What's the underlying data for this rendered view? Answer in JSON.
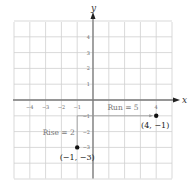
{
  "chart_data": {
    "type": "scatter",
    "title": "",
    "xlabel": "x",
    "ylabel": "y",
    "xlim": [
      -5,
      5
    ],
    "ylim": [
      -5,
      5
    ],
    "grid": true,
    "x_ticks": [
      -4,
      -3,
      -2,
      -1,
      4
    ],
    "y_ticks": [
      4,
      3,
      2,
      1,
      -1,
      -2,
      -3
    ],
    "points": [
      {
        "x": -1,
        "y": -3,
        "label": "(−1, −3)"
      },
      {
        "x": 4,
        "y": -1,
        "label": "(4, −1)"
      }
    ],
    "annotations": [
      {
        "text": "Rise = 2",
        "type": "vertical-segment",
        "from": [
          -1,
          -3
        ],
        "to": [
          -1,
          -1
        ]
      },
      {
        "text": "Run = 5",
        "type": "horizontal-arrow",
        "from": [
          -1,
          -1
        ],
        "to": [
          4,
          -1
        ]
      }
    ]
  },
  "labels": {
    "x_axis": "x",
    "y_axis": "y",
    "rise": "Rise = 2",
    "run": "Run = 5",
    "point1": "(−1, −3)",
    "point2": "(4, −1)"
  }
}
